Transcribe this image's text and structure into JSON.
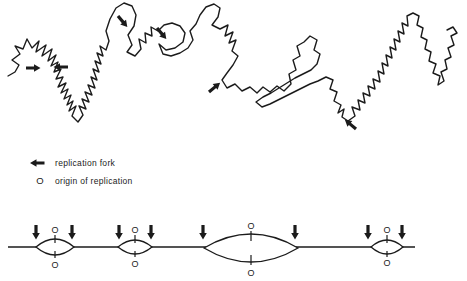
{
  "figure": {
    "type": "dna-replication-diagram",
    "colors": {
      "ink": "#1b1b1b",
      "background": "#ffffff"
    },
    "chromosome": {
      "description": "hand-drawn wiggly chromosome strand",
      "fork_arrow_count": 6,
      "fork_arrow_icon": "solid-replication-fork-arrow"
    },
    "legend": {
      "fork": {
        "icon": "left-arrow-icon",
        "label": "replication fork"
      },
      "origin": {
        "symbol": "O",
        "label": "origin of replication"
      }
    },
    "map": {
      "description": "linear DNA with replication bubbles",
      "origin_label": "O",
      "bubble_count": 4,
      "bubble_sizes": [
        "small",
        "small",
        "large",
        "small"
      ],
      "fork_arrow_count": 8
    }
  }
}
